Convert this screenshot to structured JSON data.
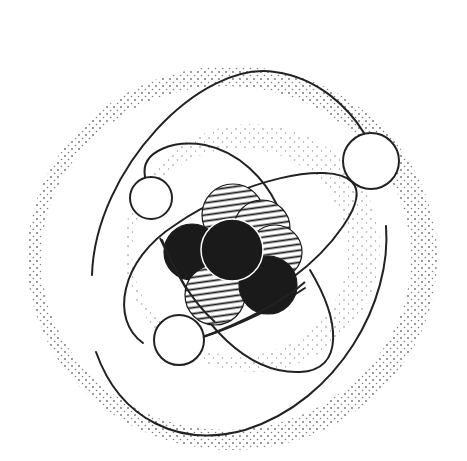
{
  "diagram": {
    "colors": {
      "background": "#ffffff",
      "line": "#222222",
      "proton_fill": "#1a1a1a",
      "stipple": "#555555"
    },
    "nucleus": {
      "nucleons": [
        {
          "type": "neutron",
          "style": "hatched",
          "cx": 233,
          "cy": 215,
          "r": 31
        },
        {
          "type": "neutron",
          "style": "hatched",
          "cx": 262,
          "cy": 228,
          "r": 28
        },
        {
          "type": "neutron",
          "style": "hatched",
          "cx": 275,
          "cy": 252,
          "r": 27
        },
        {
          "type": "proton",
          "style": "solid",
          "cx": 192,
          "cy": 252,
          "r": 28
        },
        {
          "type": "neutron",
          "style": "hatched",
          "cx": 215,
          "cy": 295,
          "r": 30
        },
        {
          "type": "proton",
          "style": "solid",
          "cx": 268,
          "cy": 285,
          "r": 29
        },
        {
          "type": "proton",
          "style": "solid",
          "cx": 232,
          "cy": 250,
          "r": 31
        }
      ]
    },
    "electrons": [
      {
        "cx": 371,
        "cy": 161,
        "r": 28
      },
      {
        "cx": 151,
        "cy": 198,
        "r": 21
      },
      {
        "cx": 179,
        "cy": 340,
        "r": 25
      }
    ],
    "shells": [
      {
        "name": "inner-shell",
        "cx": 240,
        "cy": 258,
        "rx": 130,
        "ry": 110
      },
      {
        "name": "outer-shell",
        "cx": 232,
        "cy": 252,
        "rx": 205,
        "ry": 195
      }
    ]
  }
}
